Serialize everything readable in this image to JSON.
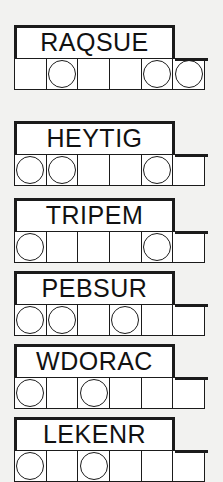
{
  "sheet": {
    "title": "Word Puzzle Worksheet",
    "background_color": "#f2f2f0",
    "ink_color": "#1b1b1b",
    "paper_color": "#ffffff",
    "cells_per_row": 6,
    "rows_visible": 6
  },
  "puzzles": [
    {
      "id": "puzzle-1",
      "word": "RAQSUE",
      "letter_count": 6,
      "circled_cells": [
        2,
        5,
        6
      ],
      "cells": [
        {
          "index": 1,
          "value": "",
          "circled": false
        },
        {
          "index": 2,
          "value": "",
          "circled": true
        },
        {
          "index": 3,
          "value": "",
          "circled": false
        },
        {
          "index": 4,
          "value": "",
          "circled": false
        },
        {
          "index": 5,
          "value": "",
          "circled": true
        },
        {
          "index": 6,
          "value": "",
          "circled": true
        }
      ]
    },
    {
      "id": "puzzle-2",
      "word": "HEYTIG",
      "letter_count": 6,
      "circled_cells": [
        1,
        2,
        5
      ],
      "cells": [
        {
          "index": 1,
          "value": "",
          "circled": true
        },
        {
          "index": 2,
          "value": "",
          "circled": true
        },
        {
          "index": 3,
          "value": "",
          "circled": false
        },
        {
          "index": 4,
          "value": "",
          "circled": false
        },
        {
          "index": 5,
          "value": "",
          "circled": true
        },
        {
          "index": 6,
          "value": "",
          "circled": false
        }
      ]
    },
    {
      "id": "puzzle-3",
      "word": "TRIPEM",
      "letter_count": 6,
      "circled_cells": [
        1,
        5
      ],
      "cells": [
        {
          "index": 1,
          "value": "",
          "circled": true
        },
        {
          "index": 2,
          "value": "",
          "circled": false
        },
        {
          "index": 3,
          "value": "",
          "circled": false
        },
        {
          "index": 4,
          "value": "",
          "circled": false
        },
        {
          "index": 5,
          "value": "",
          "circled": true
        },
        {
          "index": 6,
          "value": "",
          "circled": false
        }
      ]
    },
    {
      "id": "puzzle-4",
      "word": "PEBSUR",
      "letter_count": 6,
      "circled_cells": [
        1,
        2,
        4
      ],
      "cells": [
        {
          "index": 1,
          "value": "",
          "circled": true
        },
        {
          "index": 2,
          "value": "",
          "circled": true
        },
        {
          "index": 3,
          "value": "",
          "circled": false
        },
        {
          "index": 4,
          "value": "",
          "circled": true
        },
        {
          "index": 5,
          "value": "",
          "circled": false
        },
        {
          "index": 6,
          "value": "",
          "circled": false
        }
      ]
    },
    {
      "id": "puzzle-5",
      "word": "WDORAC",
      "letter_count": 6,
      "circled_cells": [
        1,
        3
      ],
      "cells": [
        {
          "index": 1,
          "value": "",
          "circled": true
        },
        {
          "index": 2,
          "value": "",
          "circled": false
        },
        {
          "index": 3,
          "value": "",
          "circled": true
        },
        {
          "index": 4,
          "value": "",
          "circled": false
        },
        {
          "index": 5,
          "value": "",
          "circled": false
        },
        {
          "index": 6,
          "value": "",
          "circled": false
        }
      ]
    },
    {
      "id": "puzzle-6",
      "word": "LEKENR",
      "letter_count": 6,
      "circled_cells": [
        1,
        3
      ],
      "clipped_at_bottom": true,
      "cells": [
        {
          "index": 1,
          "value": "",
          "circled": true
        },
        {
          "index": 2,
          "value": "",
          "circled": false
        },
        {
          "index": 3,
          "value": "",
          "circled": true
        },
        {
          "index": 4,
          "value": "",
          "circled": false
        },
        {
          "index": 5,
          "value": "",
          "circled": false
        },
        {
          "index": 6,
          "value": "",
          "circled": false
        }
      ]
    }
  ],
  "layout": {
    "unit_tops": [
      25,
      121,
      198,
      271,
      344,
      417
    ]
  }
}
